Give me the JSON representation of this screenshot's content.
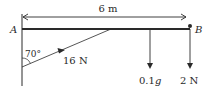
{
  "diagram": {
    "type": "statics-beam",
    "dimension": {
      "label": "6 m"
    },
    "points": {
      "A": "A",
      "B": "B"
    },
    "string": {
      "tension_label": "16 N",
      "angle_label": "70°"
    },
    "loads": [
      {
        "label_num": "0.1",
        "label_var": "g"
      },
      {
        "label": "2 N"
      }
    ],
    "colors": {
      "line": "#2a2a2a",
      "background": "#ffffff"
    }
  }
}
